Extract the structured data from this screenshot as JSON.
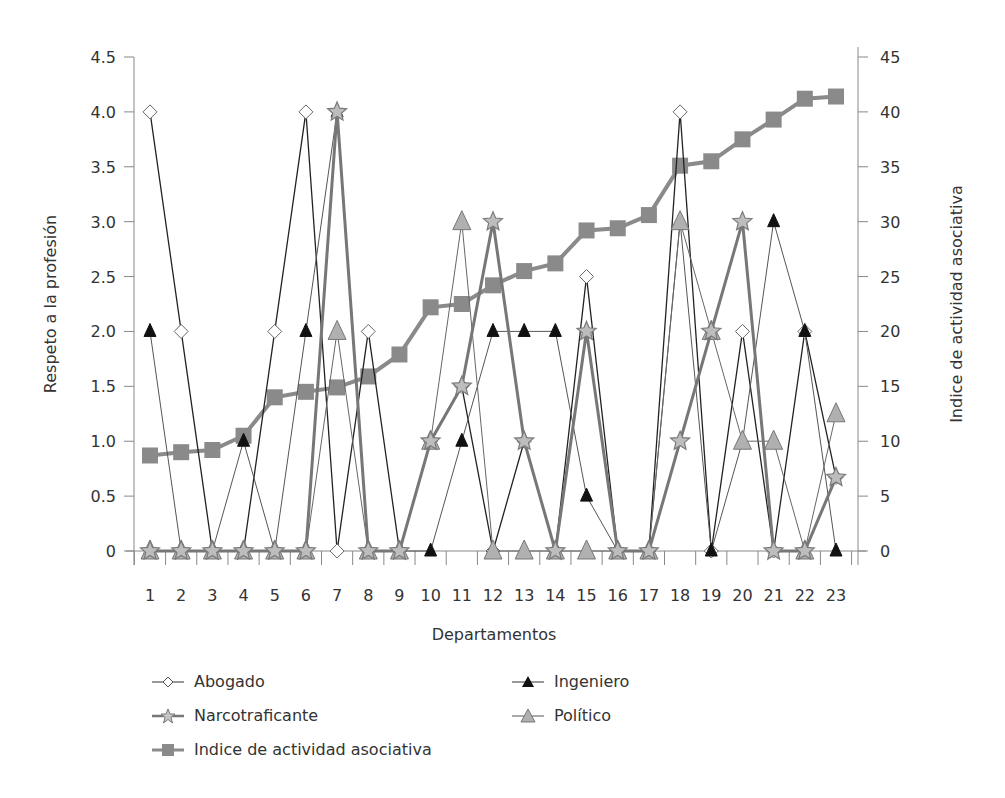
{
  "chart_data": {
    "type": "line",
    "title": "",
    "xlabel": "Departamentos",
    "ylabel": "Respeto a la profesión",
    "y2label": "Indice de actividad asociativa",
    "categories": [
      "1",
      "2",
      "3",
      "4",
      "5",
      "6",
      "7",
      "8",
      "9",
      "10",
      "11",
      "12",
      "13",
      "14",
      "15",
      "16",
      "17",
      "18",
      "19",
      "20",
      "21",
      "22",
      "23"
    ],
    "ylim": [
      0,
      4.5
    ],
    "y2lim": [
      0,
      45
    ],
    "yticks": [
      "0",
      "0.5",
      "1.0",
      "1.5",
      "2.0",
      "2.5",
      "3.0",
      "3.5",
      "4.0",
      "4.5"
    ],
    "y2ticks": [
      "0",
      "5",
      "10",
      "15",
      "20",
      "25",
      "30",
      "35",
      "40",
      "45"
    ],
    "grid": false,
    "legend_position": "bottom",
    "series": [
      {
        "name": "Abogado",
        "axis": "left",
        "marker": "diamond",
        "color": "#222222",
        "fill": "#ffffff",
        "values": [
          4,
          2,
          0,
          0,
          2,
          4,
          0,
          2,
          0,
          1,
          1.5,
          0,
          1,
          0,
          2.5,
          0,
          0,
          4,
          0,
          2,
          0,
          2,
          0.67
        ]
      },
      {
        "name": "Ingeniero",
        "axis": "left",
        "marker": "triangle",
        "color": "#555555",
        "fill": "#111111",
        "values": [
          2,
          0,
          0,
          1,
          0,
          2,
          4,
          0,
          0,
          0,
          1,
          2,
          2,
          2,
          0.5,
          0,
          0,
          3,
          0,
          1,
          3,
          2,
          0
        ]
      },
      {
        "name": "Narcotraficante",
        "axis": "left",
        "marker": "star",
        "color": "#777777",
        "fill": "#bdbdbd",
        "values": [
          0,
          0,
          0,
          0,
          0,
          0,
          4,
          0,
          0,
          1,
          1.5,
          3,
          1,
          0,
          2,
          0,
          0,
          1,
          2,
          3,
          0,
          0,
          0.67
        ]
      },
      {
        "name": "Político",
        "axis": "left",
        "marker": "triangle",
        "color": "#666666",
        "fill": "#b0b0b0",
        "values": [
          0,
          0,
          0,
          0,
          0,
          0,
          2,
          0,
          0,
          1,
          3,
          0,
          0,
          0,
          0,
          0,
          0,
          3,
          2,
          1,
          1,
          0,
          1.25
        ]
      },
      {
        "name": "Indice de actividad asociativa",
        "axis": "right",
        "marker": "square",
        "color": "#8a8a8a",
        "fill": "#8a8a8a",
        "values": [
          8.7,
          9.0,
          9.2,
          10.5,
          14.0,
          14.5,
          14.9,
          15.9,
          17.9,
          22.2,
          22.5,
          24.2,
          25.5,
          26.2,
          29.2,
          29.4,
          30.6,
          35.1,
          35.5,
          37.5,
          39.3,
          41.2,
          41.4
        ]
      }
    ]
  },
  "legend": {
    "items": [
      {
        "label": "Abogado"
      },
      {
        "label": "Narcotraficante"
      },
      {
        "label": "Indice de actividad asociativa"
      },
      {
        "label": "Ingeniero"
      },
      {
        "label": "Político"
      }
    ]
  }
}
